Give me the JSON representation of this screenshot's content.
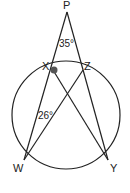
{
  "diagram": {
    "type": "circle-geometry",
    "points": {
      "P": {
        "label": "P"
      },
      "X": {
        "label": "X"
      },
      "Z": {
        "label": "Z"
      },
      "W": {
        "label": "W"
      },
      "Y": {
        "label": "Y"
      }
    },
    "segments": [
      [
        "P",
        "W"
      ],
      [
        "P",
        "Y"
      ],
      [
        "X",
        "Y"
      ],
      [
        "Z",
        "W"
      ]
    ],
    "circle_points": [
      "X",
      "Z",
      "W",
      "Y"
    ],
    "angles": [
      {
        "vertex": "P",
        "value": "35°"
      },
      {
        "vertex": "W",
        "value": "26°"
      }
    ],
    "marked_point": "X",
    "colors": {
      "stroke": "#222222",
      "marker": "#555555"
    }
  }
}
